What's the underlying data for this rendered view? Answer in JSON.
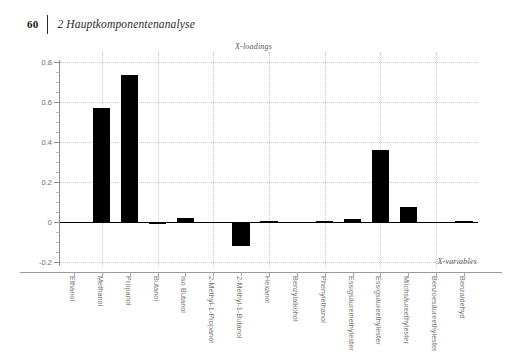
{
  "header": {
    "page_number": "60",
    "title": "2 Hauptkomponentenanalyse"
  },
  "chart_data": {
    "type": "bar",
    "title": "X-loadings",
    "xlabel": "X-variables",
    "ylabel": "",
    "ylim": [
      -0.2,
      0.8
    ],
    "yticks": [
      "-0.2",
      "0",
      "0.2",
      "0.4",
      "0.6",
      "0.8"
    ],
    "grid": true,
    "legend": "none",
    "bar_color": "#000000",
    "categories": [
      "Ethanol",
      "Methanol",
      "Propanol",
      "Butanol",
      "Iso Butanol",
      "2-Methyl-1-Propanol",
      "2-Methyl-1-Butanol",
      "Hexanol",
      "Benzylalkohol",
      "Phenylethanol",
      "Essigsäuremethylester",
      "Essigsäureethylester",
      "Milchsäureethylester",
      "Benzoesäureethylester",
      "Benzaldehyd"
    ],
    "values": [
      -0.005,
      0.57,
      0.735,
      -0.008,
      0.022,
      -0.006,
      -0.12,
      0.004,
      -0.004,
      0.003,
      0.015,
      0.358,
      0.076,
      -0.004,
      0.003
    ]
  }
}
